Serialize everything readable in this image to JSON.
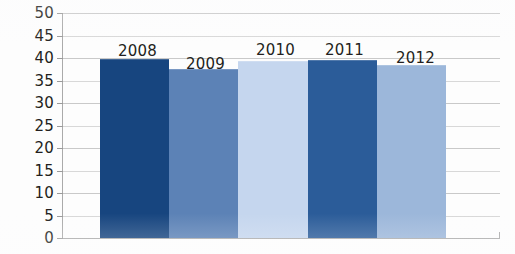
{
  "chart_data": {
    "type": "bar",
    "title": "",
    "subtitle": "",
    "xlabel": "",
    "ylabel": "",
    "categories": [
      "2008",
      "2009",
      "2010",
      "2011",
      "2012"
    ],
    "values": [
      39.7,
      37.5,
      39.3,
      39.5,
      38.4
    ],
    "data_labels": [
      "2008",
      "2009",
      "2010",
      "2011",
      "2012"
    ],
    "ylim": [
      0,
      50
    ],
    "ytick_step": 5,
    "yticks": [
      "50",
      "45",
      "40",
      "35",
      "30",
      "25",
      "20",
      "15",
      "10",
      "5",
      "0"
    ],
    "grid": true,
    "grid_orientation": "horizontal",
    "legend": false,
    "legend_position": "none",
    "bar_gap": 0,
    "series": [
      {
        "name": "Series 1",
        "values": [
          39.7,
          37.5,
          39.3,
          39.5,
          38.4
        ],
        "colors": [
          "#17457f",
          "#5c82b6",
          "#c5d6ee",
          "#2b5c99",
          "#9cb7da"
        ]
      }
    ]
  },
  "colors": {
    "bar_2008": "#17457f",
    "bar_2009": "#5c82b6",
    "bar_2010": "#c5d6ee",
    "bar_2011": "#2b5c99",
    "bar_2012": "#9cb7da",
    "gridline": "#c9c9c9",
    "axis": "#aaaaaa",
    "text": "#231f20",
    "background": "#fdfdfd"
  }
}
